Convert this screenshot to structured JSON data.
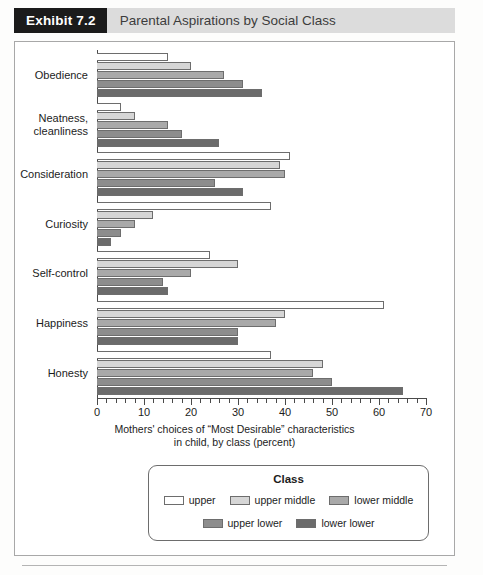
{
  "header": {
    "exhibit_tag": "Exhibit 7.2",
    "title": "Parental Aspirations by Social Class"
  },
  "legend": {
    "title": "Class",
    "row1": [
      {
        "label": "upper",
        "color": "#ffffff"
      },
      {
        "label": "upper middle",
        "color": "#d6d6d6"
      },
      {
        "label": "lower middle",
        "color": "#a9a9a9"
      }
    ],
    "row2": [
      {
        "label": "upper lower",
        "color": "#8d8d8d"
      },
      {
        "label": "lower lower",
        "color": "#6b6b6b"
      }
    ]
  },
  "axis": {
    "caption_line1": "Mothers' choices of “Most Desirable” characteristics",
    "caption_line2": "in child, by class (percent)",
    "tick_labels": [
      "0",
      "10",
      "20",
      "30",
      "40",
      "50",
      "60",
      "70"
    ]
  },
  "chart_data": {
    "type": "bar",
    "orientation": "horizontal",
    "title": "Parental Aspirations by Social Class",
    "xlabel": "Mothers' choices of “Most Desirable” characteristics in child, by class (percent)",
    "ylabel": "",
    "xlim": [
      0,
      70
    ],
    "xticks": [
      0,
      10,
      20,
      30,
      40,
      50,
      60,
      70
    ],
    "minor_tick_step": 2,
    "grid": false,
    "legend_position": "bottom",
    "legend_title": "Class",
    "categories": [
      "Obedience",
      "Neatness, cleanliness",
      "Consideration",
      "Curiosity",
      "Self-control",
      "Happiness",
      "Honesty"
    ],
    "series": [
      {
        "name": "upper",
        "color": "#ffffff",
        "values": [
          15,
          5,
          41,
          37,
          24,
          61,
          37
        ]
      },
      {
        "name": "upper middle",
        "color": "#d6d6d6",
        "values": [
          20,
          8,
          39,
          12,
          30,
          40,
          48
        ]
      },
      {
        "name": "lower middle",
        "color": "#a9a9a9",
        "values": [
          27,
          15,
          40,
          8,
          20,
          38,
          46
        ]
      },
      {
        "name": "upper lower",
        "color": "#8d8d8d",
        "values": [
          31,
          18,
          25,
          5,
          14,
          30,
          50
        ]
      },
      {
        "name": "lower lower",
        "color": "#6b6b6b",
        "values": [
          35,
          26,
          31,
          3,
          15,
          30,
          65
        ]
      }
    ]
  }
}
